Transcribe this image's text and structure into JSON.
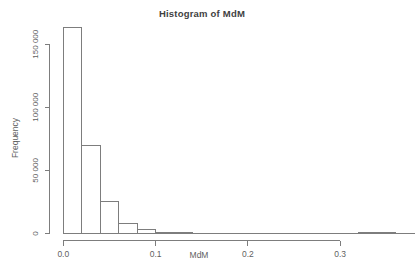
{
  "chart_data": {
    "type": "bar",
    "subtype": "histogram",
    "title": "Histogram of MdM",
    "xlabel": "MdM",
    "ylabel": "Frequency",
    "xlim": [
      0.0,
      0.38
    ],
    "ylim": [
      0,
      165000
    ],
    "grid": false,
    "legend": "none",
    "bin_edges": [
      0.0,
      0.02,
      0.04,
      0.06,
      0.08,
      0.1,
      0.12,
      0.14,
      0.16,
      0.18,
      0.2,
      0.22,
      0.24,
      0.26,
      0.28,
      0.3,
      0.32,
      0.34,
      0.36,
      0.38
    ],
    "counts": [
      163000,
      70000,
      25600,
      7900,
      3400,
      800,
      500,
      350,
      250,
      200,
      150,
      120,
      100,
      90,
      80,
      70,
      1100,
      900,
      250
    ],
    "x_ticks": [
      {
        "value": 0.0,
        "label": "0.0"
      },
      {
        "value": 0.1,
        "label": "0.1"
      },
      {
        "value": 0.2,
        "label": "0.2"
      },
      {
        "value": 0.3,
        "label": "0.3"
      }
    ],
    "y_ticks": [
      {
        "value": 0,
        "label": "0"
      },
      {
        "value": 50000,
        "label": "50 000"
      },
      {
        "value": 100000,
        "label": "100 000"
      },
      {
        "value": 150000,
        "label": "150 000"
      }
    ],
    "colors": {
      "bar_fill": "#ffffff",
      "line": "#7d7d7d",
      "tick_text": "#5f5f5f",
      "title_text": "#3f3f3f"
    }
  }
}
